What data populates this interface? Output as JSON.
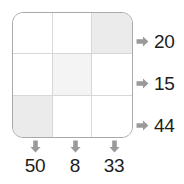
{
  "puzzle": {
    "type": "grid-sum-puzzle",
    "rows": 3,
    "columns": 3,
    "arrow_color": "#999999",
    "grid_border_color": "#a9a9a9",
    "grid_line_color": "#d7d7d7",
    "shade_strong_color": "#ebebeb",
    "shade_soft_color": "#f4f4f4",
    "cells": [
      [
        {
          "shade": "none",
          "value": ""
        },
        {
          "shade": "none",
          "value": ""
        },
        {
          "shade": "strong",
          "value": ""
        }
      ],
      [
        {
          "shade": "none",
          "value": ""
        },
        {
          "shade": "soft",
          "value": ""
        },
        {
          "shade": "none",
          "value": ""
        }
      ],
      [
        {
          "shade": "strong",
          "value": ""
        },
        {
          "shade": "none",
          "value": ""
        },
        {
          "shade": "none",
          "value": ""
        }
      ]
    ],
    "row_totals": [
      {
        "label": "20",
        "arrow": "arrow-right-icon"
      },
      {
        "label": "15",
        "arrow": "arrow-right-icon"
      },
      {
        "label": "44",
        "arrow": "arrow-right-icon"
      }
    ],
    "column_totals": [
      {
        "label": "50",
        "arrow": "arrow-down-icon"
      },
      {
        "label": "8",
        "arrow": "arrow-down-icon"
      },
      {
        "label": "33",
        "arrow": "arrow-down-icon"
      }
    ]
  }
}
